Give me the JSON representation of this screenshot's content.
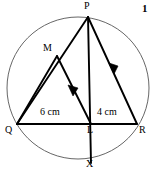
{
  "figure": {
    "number_label": "1",
    "kind": "circle-geometry-diagram",
    "stroke_color": "#000000",
    "circle_color": "#4d4d4d",
    "background_color": "#ffffff",
    "points": [
      {
        "name": "P",
        "label": "P",
        "x": 88,
        "y": 17,
        "label_x": 85,
        "label_y": 2
      },
      {
        "name": "M",
        "label": "M",
        "x": 57,
        "y": 56,
        "label_x": 44,
        "label_y": 44
      },
      {
        "name": "Q",
        "label": "Q",
        "x": 17,
        "y": 124,
        "label_x": 6,
        "label_y": 126
      },
      {
        "name": "L",
        "label": "L",
        "x": 91,
        "y": 124,
        "label_x": 88,
        "label_y": 126
      },
      {
        "name": "R",
        "label": "R",
        "x": 137,
        "y": 124,
        "label_x": 139,
        "label_y": 126
      },
      {
        "name": "X",
        "label": "X",
        "x": 91,
        "y": 163,
        "label_x": 87,
        "label_y": 160
      }
    ],
    "measurements": [
      {
        "name": "QL",
        "text": "6 cm",
        "x": 42,
        "y": 108
      },
      {
        "name": "LR",
        "text": "4 cm",
        "x": 98,
        "y": 108
      }
    ],
    "circle": {
      "cx": 78,
      "cy": 88,
      "r": 71
    },
    "segments": [
      {
        "name": "chord-QR",
        "from": "Q",
        "to": "R"
      },
      {
        "name": "chord-PQ",
        "from": "P",
        "to": "Q"
      },
      {
        "name": "chord-PR",
        "from": "P",
        "to": "R"
      },
      {
        "name": "chord-PX",
        "from": "P",
        "to": "X"
      },
      {
        "name": "segment-QM",
        "from": "Q",
        "to": "M"
      },
      {
        "name": "segment-ML",
        "from": "M",
        "to": "L"
      }
    ],
    "parallel_marks": [
      {
        "name": "arrow-on-ML",
        "on": "segment-ML"
      },
      {
        "name": "arrow-on-PR",
        "on": "chord-PR"
      }
    ]
  }
}
